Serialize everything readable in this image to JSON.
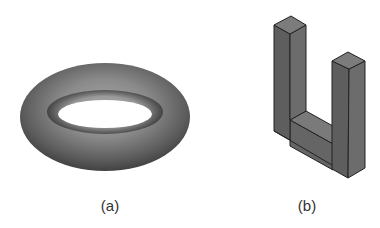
{
  "figures": [
    {
      "id": "a",
      "caption": "(a)",
      "shape": "torus"
    },
    {
      "id": "b",
      "caption": "(b)",
      "shape": "u-shaped-block"
    }
  ],
  "colors": {
    "background": "#ffffff",
    "torus_light": "#9a9a9a",
    "torus_dark": "#3a3a3a",
    "block_face": "#6e6e6e",
    "block_top": "#7a7a7a",
    "block_edge": "#222222",
    "caption": "#333333"
  }
}
